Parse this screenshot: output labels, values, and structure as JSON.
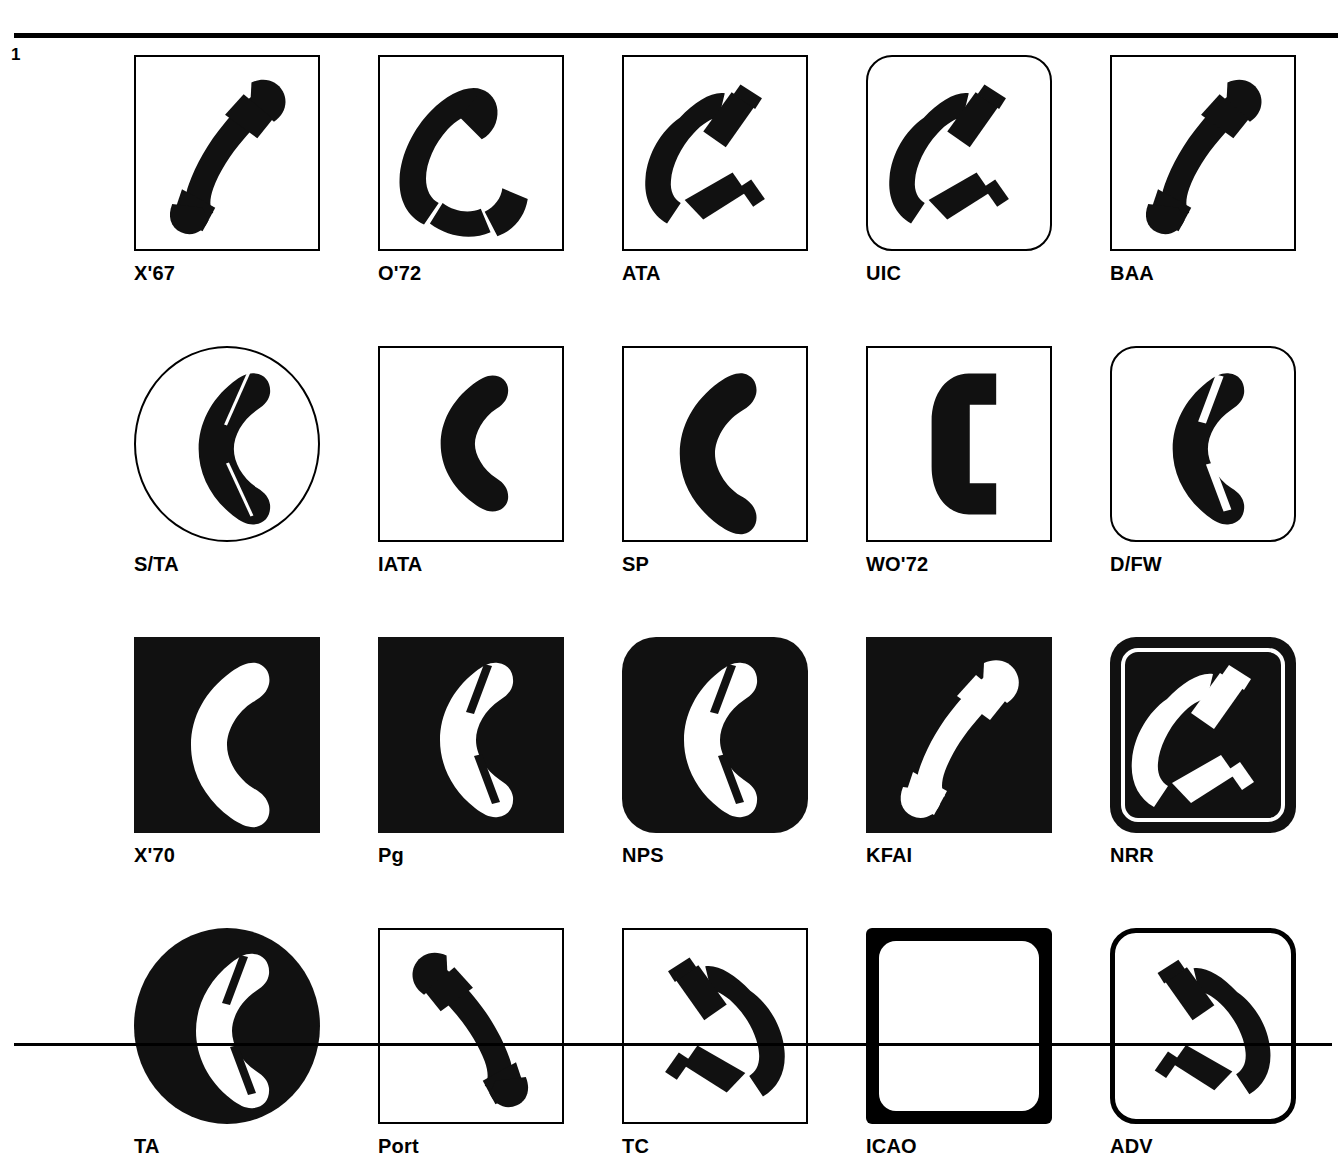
{
  "page": {
    "number": "1",
    "top_rule": true,
    "bottom_rule": true,
    "background_color": "#ffffff",
    "ink_color": "#000000"
  },
  "grid": {
    "columns": 5,
    "rows": 4,
    "total_symbols": 20
  },
  "symbols": [
    {
      "label": "X'67",
      "frame": "square",
      "handset": "diagonal-solid",
      "polarity": "black-on-white"
    },
    {
      "label": "O'72",
      "frame": "square",
      "handset": "diagonal-split",
      "polarity": "black-on-white"
    },
    {
      "label": "ATA",
      "frame": "square",
      "handset": "diagonal-split-detached",
      "polarity": "black-on-white"
    },
    {
      "label": "UIC",
      "frame": "rounded",
      "handset": "diagonal-split-detached",
      "polarity": "black-on-white"
    },
    {
      "label": "BAA",
      "frame": "square",
      "handset": "diagonal-solid",
      "polarity": "black-on-white"
    },
    {
      "label": "S/TA",
      "frame": "circle",
      "handset": "vertical-hairline-split",
      "polarity": "black-on-white"
    },
    {
      "label": "IATA",
      "frame": "square",
      "handset": "vertical-solid",
      "polarity": "black-on-white"
    },
    {
      "label": "SP",
      "frame": "square",
      "handset": "vertical-round",
      "polarity": "black-on-white"
    },
    {
      "label": "WO'72",
      "frame": "square",
      "handset": "vertical-angular",
      "polarity": "black-on-white"
    },
    {
      "label": "D/FW",
      "frame": "rounded",
      "handset": "vertical-split",
      "polarity": "black-on-white"
    },
    {
      "label": "X'70",
      "frame": "black-square",
      "handset": "vertical-round",
      "polarity": "white-on-black"
    },
    {
      "label": "Pg",
      "frame": "black-square",
      "handset": "vertical-split",
      "polarity": "white-on-black"
    },
    {
      "label": "NPS",
      "frame": "black-rounded",
      "handset": "vertical-split",
      "polarity": "white-on-black"
    },
    {
      "label": "KFAI",
      "frame": "black-square",
      "handset": "diagonal-solid",
      "polarity": "white-on-black"
    },
    {
      "label": "NRR",
      "frame": "black-outlined-rounded",
      "handset": "diagonal-split-detached",
      "polarity": "white-on-black"
    },
    {
      "label": "TA",
      "frame": "black-circle",
      "handset": "vertical-split",
      "polarity": "white-on-black"
    },
    {
      "label": "Port",
      "frame": "square",
      "handset": "mirrored-solid",
      "polarity": "black-on-white"
    },
    {
      "label": "TC",
      "frame": "square",
      "handset": "mirrored-split-detached",
      "polarity": "black-on-white"
    },
    {
      "label": "ICAO",
      "frame": "thick-bordered",
      "handset": "mirrored-solid",
      "polarity": "black-on-white"
    },
    {
      "label": "ADV",
      "frame": "rounded-thick",
      "handset": "mirrored-split-detached",
      "polarity": "black-on-white"
    }
  ]
}
